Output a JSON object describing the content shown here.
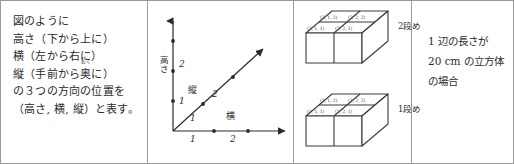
{
  "figure": {
    "border_color": "#9a9a9a",
    "background": "#ffffff",
    "ink_color": "#2b2b2b"
  },
  "explanation": {
    "lines": [
      "図のように",
      "高さ（下から上に）",
      "横（左から右に）",
      "の３つの方向の位置を",
      "（高さ, 横, 縦）と表す。"
    ],
    "ruby_line": {
      "prefix": "縦（手前から",
      "base": "奥",
      "ruby": "おく",
      "suffix": "に）"
    }
  },
  "axes": {
    "vertical_axis_label": "高さ",
    "horizontal_axis_label": "横",
    "diagonal_axis_label": "縦",
    "vertical_ticks": [
      "1",
      "2"
    ],
    "horizontal_ticks": [
      "1",
      "2"
    ],
    "diagonal_ticks": [
      "1",
      "2"
    ],
    "horizontal_tick_numbers": [
      "1",
      "2"
    ]
  },
  "cubes": {
    "upper_tier_label": "2段め",
    "lower_tier_label": "1段め",
    "upper_tier": {
      "back_row": [
        "(2, 1, 2)",
        "(2, 2, 2)"
      ],
      "front_row": [
        "(2, 1, 1)",
        "(2, 2, 1)"
      ]
    },
    "lower_tier": {
      "back_row": [
        "(1, 1, 2)",
        "(1, 2, 2)"
      ],
      "front_row": [
        "(1, 1, 1)",
        "(1, 2, 1)"
      ]
    }
  },
  "note": {
    "lines": [
      "1 辺の長さが",
      "20 cm の立方体",
      "の場合"
    ]
  }
}
